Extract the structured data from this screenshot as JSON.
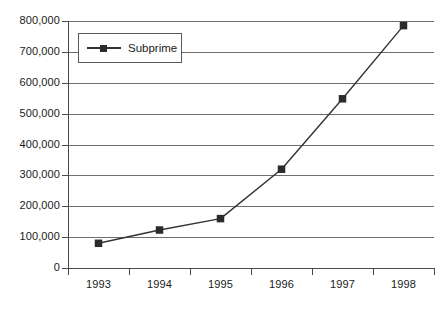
{
  "figure": {
    "background_color": "#ffffff",
    "axis_color": "#4a4a4a",
    "grid_color": "#6e6e6e",
    "series_color": "#333333",
    "marker_color": "#2b2b2b"
  },
  "legend": {
    "position": "top-left-inside",
    "entries": [
      {
        "label": "Subprime",
        "marker": "square",
        "color": "#2b2b2b"
      }
    ]
  },
  "caption": {
    "text": ""
  },
  "chart_data": {
    "type": "line",
    "title": "",
    "subtitle": "",
    "xlabel": "",
    "ylabel": "",
    "grid": true,
    "legend_position": "upper left",
    "categories": [
      "1993",
      "1994",
      "1995",
      "1996",
      "1997",
      "1998"
    ],
    "x": [
      "1993",
      "1994",
      "1995",
      "1996",
      "1997",
      "1998"
    ],
    "ylim": [
      0,
      800000
    ],
    "ytick_values": [
      0,
      100000,
      200000,
      300000,
      400000,
      500000,
      600000,
      700000,
      800000
    ],
    "ytick_labels": [
      "0",
      "100,000",
      "200,000",
      "300,000",
      "400,000",
      "500,000",
      "600,000",
      "700,000",
      "800,000"
    ],
    "xtick_labels": [
      "1993",
      "1994",
      "1995",
      "1996",
      "1997",
      "1998"
    ],
    "series": [
      {
        "name": "Subprime",
        "marker": "square",
        "color": "#333333",
        "values": [
          80000,
          123000,
          160000,
          320000,
          548000,
          785000
        ]
      }
    ],
    "annotations": []
  }
}
